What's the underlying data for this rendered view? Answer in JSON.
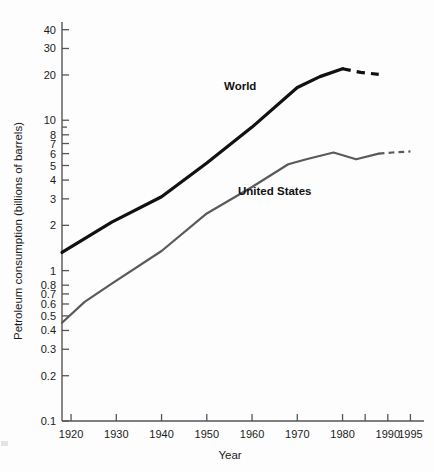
{
  "chart_data": {
    "type": "line",
    "title": "",
    "xlabel": "Year",
    "ylabel": "Petroleum consumption (billions of barrels)",
    "yscale": "log",
    "ylim": [
      0.1,
      45
    ],
    "xlim": [
      1918,
      1998
    ],
    "grid": false,
    "legend_position": "inline-annotations",
    "y_ticks": [
      {
        "value": 40,
        "label": "40",
        "major": true
      },
      {
        "value": 30,
        "label": "30",
        "major": true
      },
      {
        "value": 20,
        "label": "20",
        "major": true
      },
      {
        "value": 10,
        "label": "10",
        "major": true
      },
      {
        "value": 9,
        "label": "",
        "major": false
      },
      {
        "value": 8,
        "label": "8",
        "major": true
      },
      {
        "value": 7,
        "label": "7",
        "major": true
      },
      {
        "value": 6,
        "label": "6",
        "major": true
      },
      {
        "value": 5,
        "label": "5",
        "major": true
      },
      {
        "value": 4,
        "label": "4",
        "major": true
      },
      {
        "value": 3,
        "label": "3",
        "major": true
      },
      {
        "value": 2,
        "label": "2",
        "major": true
      },
      {
        "value": 1,
        "label": "1",
        "major": true
      },
      {
        "value": 0.8,
        "label": "0.8",
        "major": true
      },
      {
        "value": 0.7,
        "label": "0.7",
        "major": true
      },
      {
        "value": 0.6,
        "label": "0.6",
        "major": true
      },
      {
        "value": 0.5,
        "label": "0.5",
        "major": true
      },
      {
        "value": 0.4,
        "label": "0.4",
        "major": true
      },
      {
        "value": 0.3,
        "label": "0.3",
        "major": true
      },
      {
        "value": 0.2,
        "label": "0.2",
        "major": true
      },
      {
        "value": 0.1,
        "label": "0.1",
        "major": true
      }
    ],
    "x_ticks": [
      {
        "value": 1920,
        "label": "1920"
      },
      {
        "value": 1930,
        "label": "1930"
      },
      {
        "value": 1940,
        "label": "1940"
      },
      {
        "value": 1950,
        "label": "1950"
      },
      {
        "value": 1960,
        "label": "1960"
      },
      {
        "value": 1970,
        "label": "1970"
      },
      {
        "value": 1980,
        "label": "1980"
      },
      {
        "value": 1985,
        "label": ""
      },
      {
        "value": 1990,
        "label": "1990"
      },
      {
        "value": 1995,
        "label": "1995"
      }
    ],
    "series": [
      {
        "name": "World",
        "label": "World",
        "color": "#111111",
        "width": 3.2,
        "solid": {
          "x": [
            1918,
            1929,
            1940,
            1950,
            1960,
            1970,
            1975,
            1980
          ],
          "y": [
            1.32,
            2.1,
            3.1,
            5.2,
            9.0,
            16.5,
            19.5,
            22.0
          ]
        },
        "dashed": {
          "x": [
            1980,
            1984,
            1988
          ],
          "y": [
            22.0,
            20.8,
            20.2
          ]
        }
      },
      {
        "name": "United States",
        "label": "United States",
        "color": "#5a5a5a",
        "width": 2.2,
        "solid": {
          "x": [
            1918,
            1923,
            1929,
            1940,
            1950,
            1960,
            1968,
            1972,
            1978,
            1983,
            1988
          ],
          "y": [
            0.45,
            0.62,
            0.82,
            1.35,
            2.4,
            3.6,
            5.1,
            5.5,
            6.1,
            5.5,
            6.0
          ]
        },
        "dashed": {
          "x": [
            1988,
            1991,
            1995
          ],
          "y": [
            6.0,
            6.1,
            6.2
          ]
        }
      }
    ]
  },
  "annotations": {
    "world_label": "World",
    "us_label": "United States"
  },
  "axes": {
    "x_title": "Year",
    "y_title": "Petroleum consumption (billions of barrels)"
  },
  "colors": {
    "world_line": "#111111",
    "us_line": "#5a5a5a",
    "axis": "#555555",
    "text": "#1b1b1b",
    "background": "#fdfdfd"
  }
}
